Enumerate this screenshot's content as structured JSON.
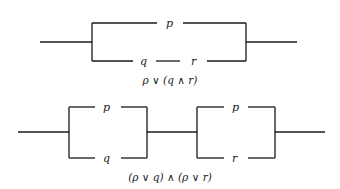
{
  "diagrams": [
    {
      "caption": "ρ ∨ (q ∧ r)",
      "labels": {
        "top": "p",
        "bottom_left": "q",
        "bottom_right": "r"
      }
    },
    {
      "caption": "(ρ ∨ q)  ∧  (ρ ∨ r)",
      "labels": {
        "box1_top": "p",
        "box1_bottom": "q",
        "box2_top": "p",
        "box2_bottom": "r"
      }
    }
  ],
  "colors": {
    "ink": "#1a1a1a",
    "background": "#ffffff"
  }
}
